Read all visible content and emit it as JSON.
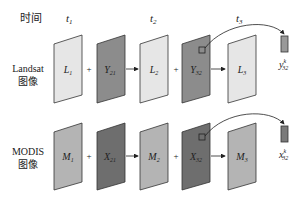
{
  "labels": {
    "time": "时间",
    "landsat_line1": "Landsat",
    "landsat_line2": "图像",
    "modis_line1": "MODIS",
    "modis_line2": "图像"
  },
  "time_points": [
    {
      "base": "t",
      "sub": "1"
    },
    {
      "base": "t",
      "sub": "2"
    },
    {
      "base": "t",
      "sub": "3"
    }
  ],
  "operators": {
    "plus": "+"
  },
  "rows": {
    "landsat": {
      "panels": [
        {
          "base": "L",
          "sub": "1",
          "fill": "#e6e6e6"
        },
        {
          "base": "Y",
          "sub": "21",
          "fill": "#8c8c8c"
        },
        {
          "base": "L",
          "sub": "2",
          "fill": "#e6e6e6"
        },
        {
          "base": "Y",
          "sub": "32",
          "fill": "#8c8c8c"
        },
        {
          "base": "L",
          "sub": "3",
          "fill": "#e6e6e6"
        }
      ],
      "pixel_output": {
        "base": "y",
        "sub": "32",
        "sup": "k",
        "fill": "#999999"
      }
    },
    "modis": {
      "panels": [
        {
          "base": "M",
          "sub": "1",
          "fill": "#b4b4b4"
        },
        {
          "base": "X",
          "sub": "21",
          "fill": "#6e6e6e"
        },
        {
          "base": "M",
          "sub": "2",
          "fill": "#b4b4b4"
        },
        {
          "base": "X",
          "sub": "32",
          "fill": "#6e6e6e"
        },
        {
          "base": "M",
          "sub": "3",
          "fill": "#b4b4b4"
        }
      ],
      "pixel_output": {
        "base": "x",
        "sub": "32",
        "sup": "k",
        "fill": "#7a7a7a"
      }
    }
  }
}
